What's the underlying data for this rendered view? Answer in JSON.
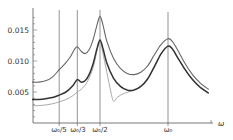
{
  "chart_data": {
    "type": "line",
    "title": "",
    "xlabel": "ω",
    "ylabel": "",
    "ylim": [
      0,
      0.0185
    ],
    "xlim_in_omega0": [
      0,
      1.33
    ],
    "grid": false,
    "legend": null,
    "yticks": [
      {
        "value": 0.005,
        "label": "0.005"
      },
      {
        "value": 0.01,
        "label": "0.010"
      },
      {
        "value": 0.015,
        "label": "0.015"
      }
    ],
    "xticks": [
      {
        "value": 0.2,
        "label": "ω₀/5"
      },
      {
        "value": 0.3333,
        "label": "ω₀/3"
      },
      {
        "value": 0.5,
        "label": "ω₀/2"
      },
      {
        "value": 1.0,
        "label": "ω₀"
      }
    ],
    "vertical_lines_at": [
      0.2,
      0.3333,
      0.5,
      1.0
    ],
    "series": [
      {
        "name": "upper curve",
        "color": "#666666",
        "width": 1.1,
        "points": [
          [
            0.0,
            0.0066
          ],
          [
            0.05,
            0.0066
          ],
          [
            0.1,
            0.0068
          ],
          [
            0.15,
            0.0074
          ],
          [
            0.2,
            0.0086
          ],
          [
            0.24,
            0.0095
          ],
          [
            0.28,
            0.0106
          ],
          [
            0.31,
            0.0118
          ],
          [
            0.3333,
            0.0123
          ],
          [
            0.36,
            0.0116
          ],
          [
            0.39,
            0.0112
          ],
          [
            0.42,
            0.0118
          ],
          [
            0.45,
            0.0135
          ],
          [
            0.48,
            0.016
          ],
          [
            0.5,
            0.0172
          ],
          [
            0.52,
            0.016
          ],
          [
            0.55,
            0.0132
          ],
          [
            0.6,
            0.0104
          ],
          [
            0.65,
            0.0088
          ],
          [
            0.7,
            0.008
          ],
          [
            0.75,
            0.0078
          ],
          [
            0.8,
            0.0082
          ],
          [
            0.85,
            0.0092
          ],
          [
            0.9,
            0.011
          ],
          [
            0.95,
            0.0127
          ],
          [
            1.0,
            0.0136
          ],
          [
            1.03,
            0.0132
          ],
          [
            1.07,
            0.0118
          ],
          [
            1.12,
            0.0098
          ],
          [
            1.18,
            0.0078
          ],
          [
            1.24,
            0.0064
          ],
          [
            1.3,
            0.0054
          ]
        ]
      },
      {
        "name": "middle curve",
        "color": "#333333",
        "width": 1.5,
        "points": [
          [
            0.0,
            0.0038
          ],
          [
            0.05,
            0.0038
          ],
          [
            0.1,
            0.0039
          ],
          [
            0.15,
            0.0041
          ],
          [
            0.2,
            0.0045
          ],
          [
            0.25,
            0.005
          ],
          [
            0.3,
            0.006
          ],
          [
            0.3333,
            0.007
          ],
          [
            0.36,
            0.0066
          ],
          [
            0.39,
            0.0068
          ],
          [
            0.42,
            0.0078
          ],
          [
            0.45,
            0.0096
          ],
          [
            0.48,
            0.0122
          ],
          [
            0.5,
            0.0134
          ],
          [
            0.52,
            0.0122
          ],
          [
            0.55,
            0.0097
          ],
          [
            0.6,
            0.0072
          ],
          [
            0.65,
            0.0059
          ],
          [
            0.7,
            0.0053
          ],
          [
            0.75,
            0.0053
          ],
          [
            0.8,
            0.0059
          ],
          [
            0.85,
            0.0071
          ],
          [
            0.9,
            0.0091
          ],
          [
            0.95,
            0.0112
          ],
          [
            1.0,
            0.0124
          ],
          [
            1.03,
            0.012
          ],
          [
            1.07,
            0.0106
          ],
          [
            1.12,
            0.0088
          ],
          [
            1.18,
            0.007
          ],
          [
            1.24,
            0.0057
          ],
          [
            1.3,
            0.0048
          ]
        ]
      },
      {
        "name": "lower curve",
        "color": "#aaaaaa",
        "width": 1.0,
        "points": [
          [
            0.0,
            0.0028
          ],
          [
            0.05,
            0.0028
          ],
          [
            0.1,
            0.0029
          ],
          [
            0.15,
            0.0031
          ],
          [
            0.2,
            0.0034
          ],
          [
            0.25,
            0.0038
          ],
          [
            0.3,
            0.0044
          ],
          [
            0.3333,
            0.005
          ],
          [
            0.37,
            0.0056
          ],
          [
            0.41,
            0.0068
          ],
          [
            0.45,
            0.009
          ],
          [
            0.48,
            0.0118
          ],
          [
            0.5,
            0.0132
          ],
          [
            0.52,
            0.0114
          ],
          [
            0.55,
            0.0082
          ],
          [
            0.58,
            0.005
          ],
          [
            0.6,
            0.0035
          ],
          [
            0.63,
            0.0042
          ],
          [
            0.68,
            0.0048
          ],
          [
            0.75,
            0.0053
          ],
          [
            0.8,
            0.0059
          ],
          [
            0.85,
            0.0071
          ],
          [
            0.9,
            0.0091
          ],
          [
            0.95,
            0.0112
          ],
          [
            1.0,
            0.0124
          ],
          [
            1.03,
            0.012
          ],
          [
            1.07,
            0.0106
          ],
          [
            1.12,
            0.0088
          ],
          [
            1.18,
            0.007
          ],
          [
            1.24,
            0.0057
          ],
          [
            1.3,
            0.0048
          ]
        ]
      }
    ]
  },
  "axis_labels": {
    "x": "ω",
    "ytick_0": "0.005",
    "ytick_1": "0.010",
    "ytick_2": "0.015",
    "xtick_0": "ω₀/5",
    "xtick_1": "ω₀/3",
    "xtick_2": "ω₀/2",
    "xtick_3": "ω₀"
  },
  "colors": {
    "axis": "#555555",
    "vline": "#666666"
  }
}
